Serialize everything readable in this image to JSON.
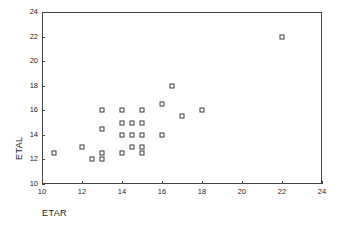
{
  "chart_data": {
    "type": "scatter",
    "title": "",
    "xlabel": "ETAR",
    "ylabel": "ETAL",
    "xlim": [
      10,
      24
    ],
    "ylim": [
      10,
      24
    ],
    "xticks": [
      10,
      12,
      14,
      16,
      18,
      20,
      22,
      24
    ],
    "yticks": [
      10,
      12,
      14,
      16,
      18,
      20,
      22,
      24
    ],
    "xticklabels": [
      "10",
      "12",
      "14",
      "16",
      "18",
      "20",
      "22",
      "24"
    ],
    "yticklabels": [
      "10",
      "12",
      "14",
      "16",
      "18",
      "20",
      "22",
      "24"
    ],
    "grid": false,
    "legend": null,
    "marker": "open-square",
    "marker_color": "#3a3a3a",
    "points": [
      {
        "x": 10.6,
        "y": 12.5
      },
      {
        "x": 12.0,
        "y": 13.0
      },
      {
        "x": 12.5,
        "y": 12.0
      },
      {
        "x": 13.0,
        "y": 12.0
      },
      {
        "x": 13.0,
        "y": 12.5
      },
      {
        "x": 13.0,
        "y": 14.5
      },
      {
        "x": 13.0,
        "y": 16.0
      },
      {
        "x": 14.0,
        "y": 12.5
      },
      {
        "x": 14.0,
        "y": 14.0
      },
      {
        "x": 14.0,
        "y": 15.0
      },
      {
        "x": 14.0,
        "y": 16.0
      },
      {
        "x": 14.5,
        "y": 13.0
      },
      {
        "x": 14.5,
        "y": 14.0
      },
      {
        "x": 14.5,
        "y": 15.0
      },
      {
        "x": 15.0,
        "y": 12.5
      },
      {
        "x": 15.0,
        "y": 13.0
      },
      {
        "x": 15.0,
        "y": 14.0
      },
      {
        "x": 15.0,
        "y": 15.0
      },
      {
        "x": 15.0,
        "y": 16.0
      },
      {
        "x": 16.0,
        "y": 14.0
      },
      {
        "x": 16.0,
        "y": 16.5
      },
      {
        "x": 16.5,
        "y": 18.0
      },
      {
        "x": 17.0,
        "y": 15.5
      },
      {
        "x": 18.0,
        "y": 16.0
      },
      {
        "x": 22.0,
        "y": 22.0
      }
    ]
  }
}
